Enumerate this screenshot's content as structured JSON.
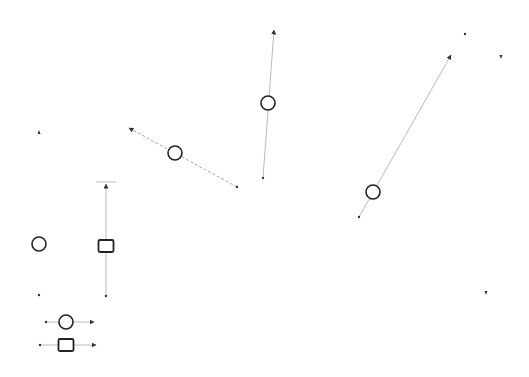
{
  "canvas": {
    "width": 529,
    "height": 377,
    "background": "#ffffff"
  },
  "colors": {
    "shape_stroke": "#222222",
    "line": "#bbbbbb",
    "dashed_line": "#aaaaaa",
    "arrowhead": "#333333"
  },
  "nodes": [
    {
      "id": "circle-dashed-diagonal",
      "shape": "circle",
      "x": 175,
      "y": 153,
      "r": 7
    },
    {
      "id": "circle-vertical-top",
      "shape": "circle",
      "x": 268,
      "y": 103,
      "r": 7
    },
    {
      "id": "circle-long-diagonal",
      "shape": "circle",
      "x": 373,
      "y": 192,
      "r": 7
    },
    {
      "id": "circle-left-isolated",
      "shape": "circle",
      "x": 39,
      "y": 244,
      "r": 7
    },
    {
      "id": "square-vertical-left",
      "shape": "square",
      "x": 106,
      "y": 246,
      "w": 15,
      "h": 12
    },
    {
      "id": "circle-legend",
      "shape": "circle",
      "x": 66,
      "y": 322,
      "r": 7
    },
    {
      "id": "square-legend",
      "shape": "square",
      "x": 66,
      "y": 345,
      "w": 15,
      "h": 12
    }
  ],
  "vectors": [
    {
      "id": "vector-dashed-diagonal",
      "x1": 237,
      "y1": 187,
      "x2": 129,
      "y2": 128,
      "style": "dashed"
    },
    {
      "id": "vector-vertical-top",
      "x1": 263,
      "y1": 178,
      "x2": 274,
      "y2": 30,
      "style": "solid"
    },
    {
      "id": "vector-long-diagonal",
      "x1": 359,
      "y1": 217,
      "x2": 451,
      "y2": 55,
      "style": "solid"
    },
    {
      "id": "vector-vertical-left",
      "x1": 106,
      "y1": 296,
      "x2": 106,
      "y2": 184,
      "style": "solid",
      "cap_bar": true
    },
    {
      "id": "vector-legend-circle",
      "x1": 46,
      "y1": 322,
      "x2": 94,
      "y2": 322,
      "style": "solid"
    },
    {
      "id": "vector-legend-square",
      "x1": 40,
      "y1": 345,
      "x2": 96,
      "y2": 345,
      "style": "solid"
    }
  ],
  "markers": [
    {
      "id": "marker-1",
      "x": 39,
      "y": 132,
      "dir": "up"
    },
    {
      "id": "marker-2",
      "x": 39,
      "y": 295,
      "dir": "dot"
    },
    {
      "id": "marker-3",
      "x": 465,
      "y": 34,
      "dir": "dot"
    },
    {
      "id": "marker-4",
      "x": 501,
      "y": 57,
      "dir": "down"
    },
    {
      "id": "marker-5",
      "x": 486,
      "y": 293,
      "dir": "down"
    }
  ]
}
